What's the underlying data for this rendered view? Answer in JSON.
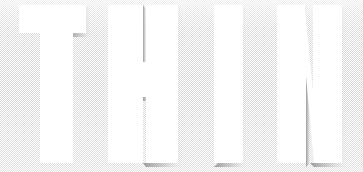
{
  "poster": {
    "headline_text": "THIN",
    "headline_letters": [
      "T",
      "H",
      "I",
      "N"
    ],
    "alt_text": "THIN",
    "canvas": {
      "width": 363,
      "height": 172
    }
  },
  "colors": {
    "letter_fill": "#ffffff",
    "background_base": "#ffffff",
    "background_dither": "#d6d6d6",
    "shadow_dark": "#8c8c8c",
    "shadow_mid": "#b4b4b4",
    "shadow_light": "#dcdcdc"
  },
  "typography": {
    "style_label": "condensed-ultra-bold-sans",
    "cap_height_px": 158,
    "baseline_y": 163,
    "cap_top_y": 5
  },
  "letters": [
    {
      "name": "letter-T",
      "glyph": "T",
      "path": "M19,5 H86 V33 H73 V163 H40 V33 H19 Z"
    },
    {
      "name": "letter-H",
      "glyph": "H",
      "path": "M108,5 H143 V62 H146 V5 H178 V163 H146 V97 H143 V163 H108 Z"
    },
    {
      "name": "letter-I",
      "glyph": "I",
      "path": "M214,5 H243 V163 H214 Z"
    },
    {
      "name": "letter-N",
      "glyph": "N",
      "path": "M277,5 H305 L313,92 V5 H342 V163 H314 L306,76 V163 H277 Z"
    }
  ],
  "shadows": [
    {
      "name": "shadow-T",
      "path": "M86,5 L90,9 V37 H73 V163 L69,159 V33 H86 Z"
    },
    {
      "name": "shadow-H-left-stem",
      "path": "M143,5 L146,9 V62 H143 Z"
    },
    {
      "name": "shadow-H-right",
      "path": "M178,5 L181,9 V167 H146 L143,163 H178 Z"
    },
    {
      "name": "shadow-H-bar",
      "path": "M143,97 H146 L149,101 H143 Z"
    },
    {
      "name": "shadow-I",
      "path": "M243,5 L246,9 V167 H214 L218,163 H243 Z"
    },
    {
      "name": "shadow-N-diagonal-top",
      "path": "M305,5 L313,92 L309,96 L301,9 Z"
    },
    {
      "name": "shadow-N-right",
      "path": "M342,5 L345,9 V167 H314 L310,163 H342 Z"
    },
    {
      "name": "shadow-N-diagonal-bottom",
      "path": "M306,76 L310,80 V163 L306,167 Z"
    }
  ]
}
